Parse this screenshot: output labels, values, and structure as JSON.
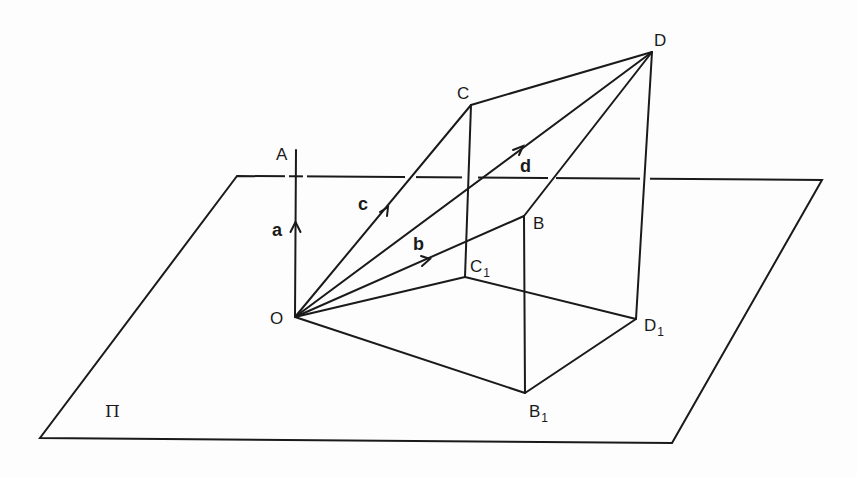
{
  "figure": {
    "plane_label": "Π",
    "points": [
      {
        "id": "O",
        "label": "O",
        "sub": "",
        "x": 295,
        "y": 317
      },
      {
        "id": "A",
        "label": "A",
        "sub": "",
        "x": 296,
        "y": 150
      },
      {
        "id": "B",
        "label": "B",
        "sub": "",
        "x": 524,
        "y": 216
      },
      {
        "id": "C",
        "label": "C",
        "sub": "",
        "x": 471,
        "y": 105
      },
      {
        "id": "D",
        "label": "D",
        "sub": "",
        "x": 652,
        "y": 52
      },
      {
        "id": "B1",
        "label": "B",
        "sub": "1",
        "x": 525,
        "y": 393
      },
      {
        "id": "C1",
        "label": "C",
        "sub": "1",
        "x": 465,
        "y": 277
      },
      {
        "id": "D1",
        "label": "D",
        "sub": "1",
        "x": 636,
        "y": 319
      }
    ],
    "vectors": [
      {
        "name": "a",
        "from": "O",
        "to": "A"
      },
      {
        "name": "b",
        "from": "O",
        "to": "B"
      },
      {
        "name": "c",
        "from": "O",
        "to": "C"
      },
      {
        "name": "d",
        "from": "O",
        "to": "D"
      }
    ],
    "plane_corners": {
      "top_left": [
        237,
        176
      ],
      "top_right": [
        822,
        180
      ],
      "bottom_right": [
        672,
        443
      ],
      "bottom_left": [
        40,
        438
      ]
    },
    "labels": {
      "A": "A",
      "B": "B",
      "C": "C",
      "D": "D",
      "O": "O",
      "B1_main": "B",
      "B1_sub": "1",
      "C1_main": "C",
      "C1_sub": "1",
      "D1_main": "D",
      "D1_sub": "1",
      "vec_a": "a",
      "vec_b": "b",
      "vec_c": "c",
      "vec_d": "d",
      "plane": "Π"
    },
    "stroke_color": "#1a1a1a",
    "background_color": "#fdfdfd"
  }
}
